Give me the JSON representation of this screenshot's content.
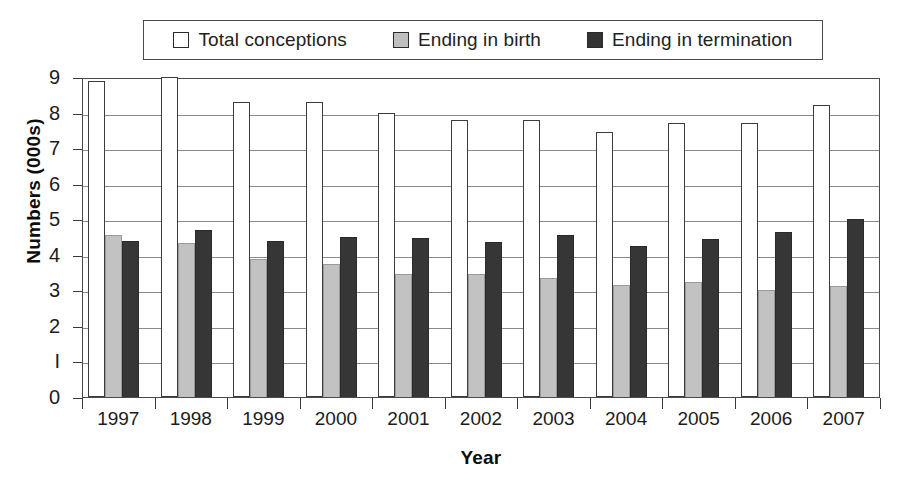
{
  "chart_data": {
    "type": "bar",
    "title": "",
    "xlabel": "Year",
    "ylabel": "Numbers (000s)",
    "categories": [
      "1997",
      "1998",
      "1999",
      "2000",
      "2001",
      "2002",
      "2003",
      "2004",
      "2005",
      "2006",
      "2007"
    ],
    "ylim": [
      0,
      9
    ],
    "yticks": [
      0,
      1,
      2,
      3,
      4,
      5,
      6,
      7,
      8,
      9
    ],
    "ytick_labels": [
      "0",
      "I",
      "2",
      "3",
      "4",
      "5",
      "6",
      "7",
      "8",
      "9"
    ],
    "grid": true,
    "legend_position": "top",
    "series": [
      {
        "name": "Total conceptions",
        "color": "#ffffff",
        "values": [
          8.9,
          9.05,
          8.3,
          8.3,
          7.98,
          7.8,
          7.8,
          7.45,
          7.72,
          7.72,
          8.2
        ]
      },
      {
        "name": "Ending in birth",
        "color": "#c2c2c2",
        "values": [
          4.55,
          4.32,
          3.88,
          3.75,
          3.45,
          3.45,
          3.36,
          3.15,
          3.24,
          3.02,
          3.12
        ]
      },
      {
        "name": "Ending in termination",
        "color": "#363636",
        "values": [
          4.4,
          4.7,
          4.4,
          4.5,
          4.48,
          4.36,
          4.56,
          4.25,
          4.44,
          4.63,
          5.0
        ]
      }
    ]
  },
  "legend": {
    "items": [
      {
        "label": "Total conceptions",
        "swatch": "total-swatch"
      },
      {
        "label": "Ending in birth",
        "swatch": "birth-swatch"
      },
      {
        "label": "Ending in termination",
        "swatch": "termination-swatch"
      }
    ]
  },
  "axes": {
    "y_title": "Numbers (000s)",
    "x_title": "Year"
  }
}
